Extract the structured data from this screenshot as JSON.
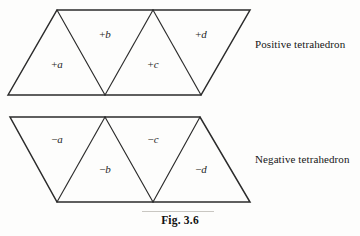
{
  "figure": {
    "caption": "Fig. 3.6",
    "captions": {
      "positive": "Positive tetrahedron",
      "negative": "Negative tetrahedron"
    }
  },
  "chart_data": {
    "type": "diagram",
    "title": "Fig. 3.6",
    "nets": [
      {
        "id": "positive-net",
        "caption": "Positive tetrahedron",
        "orientation": "parallelogram-leaning-right",
        "outline": [
          [
            8,
            95
          ],
          [
            57,
            10
          ],
          [
            250,
            10
          ],
          [
            201,
            95
          ]
        ],
        "interior_edges": [
          [
            [
              57,
              10
            ],
            [
              105,
              95
            ]
          ],
          [
            [
              105,
              95
            ],
            [
              153,
              10
            ]
          ],
          [
            [
              153,
              10
            ],
            [
              201,
              95
            ]
          ]
        ],
        "faces": [
          {
            "id": "face-pos-a",
            "sign": "+",
            "letter": "a",
            "label": "+a",
            "x": 57,
            "y": 68,
            "orientation": "up"
          },
          {
            "id": "face-pos-b",
            "sign": "+",
            "letter": "b",
            "label": "+b",
            "x": 105,
            "y": 38,
            "orientation": "down"
          },
          {
            "id": "face-pos-c",
            "sign": "+",
            "letter": "c",
            "label": "+c",
            "x": 153,
            "y": 68,
            "orientation": "up"
          },
          {
            "id": "face-pos-d",
            "sign": "+",
            "letter": "d",
            "label": "+d",
            "x": 201,
            "y": 38,
            "orientation": "down"
          }
        ]
      },
      {
        "id": "negative-net",
        "caption": "Negative tetrahedron",
        "orientation": "parallelogram-leaning-left",
        "outline": [
          [
            10,
            117
          ],
          [
            200,
            117
          ],
          [
            250,
            202
          ],
          [
            57,
            202
          ]
        ],
        "interior_edges": [
          [
            [
              57,
              202
            ],
            [
              105,
              117
            ]
          ],
          [
            [
              105,
              117
            ],
            [
              153,
              202
            ]
          ],
          [
            [
              153,
              202
            ],
            [
              200,
              117
            ]
          ]
        ],
        "faces": [
          {
            "id": "face-neg-a",
            "sign": "−",
            "letter": "a",
            "label": "−a",
            "x": 57,
            "y": 143,
            "orientation": "down"
          },
          {
            "id": "face-neg-b",
            "sign": "−",
            "letter": "b",
            "label": "−b",
            "x": 105,
            "y": 173,
            "orientation": "up"
          },
          {
            "id": "face-neg-c",
            "sign": "−",
            "letter": "c",
            "label": "−c",
            "x": 153,
            "y": 143,
            "orientation": "down"
          },
          {
            "id": "face-neg-d",
            "sign": "−",
            "letter": "d",
            "label": "−d",
            "x": 201,
            "y": 173,
            "orientation": "up"
          }
        ]
      }
    ],
    "colors": {
      "stroke": "#2b2b2b",
      "text": "#1a1a1a",
      "background": "#fdfdfc",
      "rule": "#c9c7c2"
    }
  }
}
